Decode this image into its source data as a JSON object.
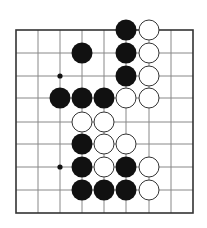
{
  "diagram": {
    "grid": {
      "cols": 9,
      "rows": 9,
      "x": [
        16,
        38,
        60,
        82,
        104,
        126,
        149,
        171,
        193
      ],
      "y": [
        30,
        53,
        76,
        98,
        122,
        144,
        167,
        190,
        213
      ],
      "border_color": "#333333",
      "line_color": "#888888"
    },
    "stone_radius": 10.5,
    "colors": {
      "black": "#111111",
      "white": "#ffffff",
      "white_outline": "#333333",
      "background": "#ffffff"
    },
    "hoshi": [
      {
        "col": 2,
        "row": 2
      },
      {
        "col": 2,
        "row": 6
      }
    ],
    "stones": [
      {
        "col": 5,
        "row": 0,
        "color": "black"
      },
      {
        "col": 6,
        "row": 0,
        "color": "white"
      },
      {
        "col": 3,
        "row": 1,
        "color": "black"
      },
      {
        "col": 5,
        "row": 1,
        "color": "black"
      },
      {
        "col": 6,
        "row": 1,
        "color": "white"
      },
      {
        "col": 5,
        "row": 2,
        "color": "black"
      },
      {
        "col": 6,
        "row": 2,
        "color": "white"
      },
      {
        "col": 2,
        "row": 3,
        "color": "black"
      },
      {
        "col": 3,
        "row": 3,
        "color": "black"
      },
      {
        "col": 4,
        "row": 3,
        "color": "black"
      },
      {
        "col": 5,
        "row": 3,
        "color": "white"
      },
      {
        "col": 6,
        "row": 3,
        "color": "white"
      },
      {
        "col": 3,
        "row": 4,
        "color": "white"
      },
      {
        "col": 4,
        "row": 4,
        "color": "white"
      },
      {
        "col": 3,
        "row": 5,
        "color": "black"
      },
      {
        "col": 4,
        "row": 5,
        "color": "white"
      },
      {
        "col": 5,
        "row": 5,
        "color": "white"
      },
      {
        "col": 3,
        "row": 6,
        "color": "black"
      },
      {
        "col": 4,
        "row": 6,
        "color": "white"
      },
      {
        "col": 5,
        "row": 6,
        "color": "black"
      },
      {
        "col": 6,
        "row": 6,
        "color": "white"
      },
      {
        "col": 3,
        "row": 7,
        "color": "black"
      },
      {
        "col": 4,
        "row": 7,
        "color": "black"
      },
      {
        "col": 5,
        "row": 7,
        "color": "black"
      },
      {
        "col": 6,
        "row": 7,
        "color": "white"
      }
    ]
  }
}
